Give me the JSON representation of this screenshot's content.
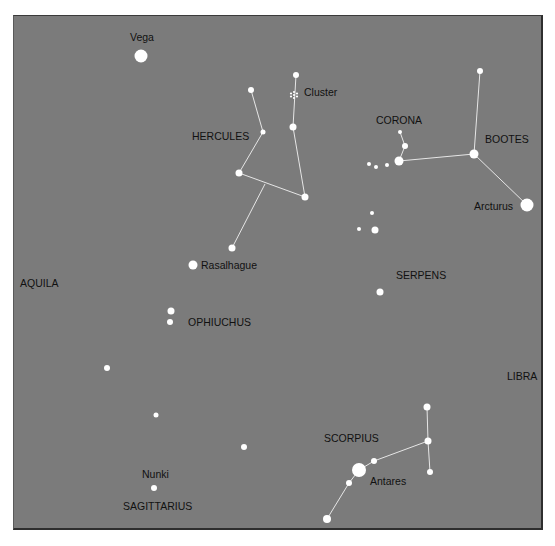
{
  "colors": {
    "background": "#7b7b7b",
    "star": "#ffffff",
    "line": "#e6e6e6",
    "label": "#111111"
  },
  "constellations": [
    {
      "name": "HERCULES",
      "x": 192,
      "y": 140
    },
    {
      "name": "CORONA",
      "x": 376,
      "y": 124
    },
    {
      "name": "BOOTES",
      "x": 485,
      "y": 143
    },
    {
      "name": "SERPENS",
      "x": 396,
      "y": 279
    },
    {
      "name": "AQUILA",
      "x": 20,
      "y": 287
    },
    {
      "name": "OPHIUCHUS",
      "x": 188,
      "y": 326
    },
    {
      "name": "LIBRA",
      "x": 507,
      "y": 380
    },
    {
      "name": "SCORPIUS",
      "x": 324,
      "y": 442
    },
    {
      "name": "SAGITTARIUS",
      "x": 123,
      "y": 510
    }
  ],
  "star_names": [
    {
      "name": "Vega",
      "x": 130,
      "y": 41
    },
    {
      "name": "Cluster",
      "x": 304,
      "y": 96
    },
    {
      "name": "Arcturus",
      "x": 474,
      "y": 210
    },
    {
      "name": "Rasalhague",
      "x": 201,
      "y": 269
    },
    {
      "name": "Antares",
      "x": 370,
      "y": 485
    },
    {
      "name": "Nunki",
      "x": 142,
      "y": 478
    }
  ],
  "stars": [
    {
      "x": 141,
      "y": 56,
      "r": 6.5,
      "label": "Vega"
    },
    {
      "x": 251,
      "y": 90,
      "r": 3
    },
    {
      "x": 263,
      "y": 132,
      "r": 2.5
    },
    {
      "x": 239,
      "y": 173,
      "r": 3.5
    },
    {
      "x": 232,
      "y": 248,
      "r": 3.5
    },
    {
      "x": 296,
      "y": 75,
      "r": 3
    },
    {
      "x": 293,
      "y": 127,
      "r": 3.5
    },
    {
      "x": 305,
      "y": 197,
      "r": 3.5
    },
    {
      "x": 400,
      "y": 132,
      "r": 2
    },
    {
      "x": 405,
      "y": 146,
      "r": 3
    },
    {
      "x": 399,
      "y": 161,
      "r": 4.5
    },
    {
      "x": 387,
      "y": 165,
      "r": 2
    },
    {
      "x": 376,
      "y": 167,
      "r": 2
    },
    {
      "x": 369,
      "y": 164,
      "r": 2
    },
    {
      "x": 480,
      "y": 71,
      "r": 3
    },
    {
      "x": 474,
      "y": 154,
      "r": 4.5
    },
    {
      "x": 527,
      "y": 205,
      "r": 6.5,
      "label": "Arcturus"
    },
    {
      "x": 372,
      "y": 213,
      "r": 2
    },
    {
      "x": 359,
      "y": 229,
      "r": 2
    },
    {
      "x": 375,
      "y": 230,
      "r": 3.5
    },
    {
      "x": 193,
      "y": 265,
      "r": 4.5,
      "label": "Rasalhague"
    },
    {
      "x": 380,
      "y": 292,
      "r": 3.5
    },
    {
      "x": 171,
      "y": 311,
      "r": 3.5
    },
    {
      "x": 170,
      "y": 322,
      "r": 3
    },
    {
      "x": 107,
      "y": 368,
      "r": 3
    },
    {
      "x": 156,
      "y": 415,
      "r": 2.5
    },
    {
      "x": 244,
      "y": 447,
      "r": 3
    },
    {
      "x": 154,
      "y": 488,
      "r": 3,
      "label": "Nunki"
    },
    {
      "x": 427,
      "y": 407,
      "r": 3.5
    },
    {
      "x": 428,
      "y": 441,
      "r": 3.5
    },
    {
      "x": 430,
      "y": 472,
      "r": 3
    },
    {
      "x": 374,
      "y": 461,
      "r": 3
    },
    {
      "x": 359,
      "y": 470,
      "r": 7,
      "label": "Antares"
    },
    {
      "x": 349,
      "y": 483,
      "r": 3
    },
    {
      "x": 327,
      "y": 519,
      "r": 4
    }
  ],
  "cluster": {
    "x": 294,
    "y": 95
  },
  "lines": [
    [
      251,
      90,
      263,
      132
    ],
    [
      263,
      132,
      239,
      173
    ],
    [
      239,
      173,
      305,
      197
    ],
    [
      265,
      184,
      232,
      248
    ],
    [
      296,
      75,
      293,
      127
    ],
    [
      293,
      127,
      305,
      197
    ],
    [
      400,
      132,
      405,
      146
    ],
    [
      405,
      146,
      399,
      161
    ],
    [
      399,
      161,
      474,
      154
    ],
    [
      480,
      71,
      474,
      154
    ],
    [
      474,
      154,
      527,
      205
    ],
    [
      427,
      407,
      428,
      441
    ],
    [
      428,
      441,
      430,
      472
    ],
    [
      428,
      441,
      374,
      461
    ],
    [
      374,
      461,
      359,
      470
    ],
    [
      359,
      470,
      349,
      483
    ],
    [
      349,
      483,
      327,
      519
    ]
  ]
}
